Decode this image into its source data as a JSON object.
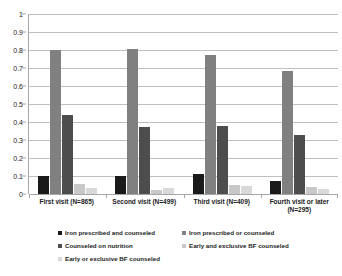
{
  "chart_data": {
    "type": "bar",
    "title": "",
    "subtitle": "",
    "xlabel": "",
    "ylabel": "",
    "ylim": [
      0,
      1
    ],
    "ytick_labels": [
      "1",
      "0.9",
      "0.8",
      "0.7",
      "0.6",
      "0.5",
      "0.4",
      "0.3",
      "0.2",
      "0.1",
      "0"
    ],
    "ytick_values": [
      1,
      0.9,
      0.8,
      0.7,
      0.6,
      0.5,
      0.4,
      0.3,
      0.2,
      0.1,
      0
    ],
    "grid": true,
    "legend_position": "bottom",
    "categories": [
      "First visit (N=865)",
      "Second visit (N=499)",
      "Third visit (N=409)",
      "Fourth visit or later (N=295)"
    ],
    "series": [
      {
        "name": "Iron prescribed and counseled",
        "color": "#1a1a1a",
        "values": [
          0.1,
          0.1,
          0.11,
          0.072
        ]
      },
      {
        "name": "Iron prescribed or counseled",
        "color": "#808080",
        "values": [
          0.8,
          0.805,
          0.775,
          0.685
        ]
      },
      {
        "name": "Counseled on nutrition",
        "color": "#4d4d4d",
        "values": [
          0.44,
          0.37,
          0.38,
          0.33
        ]
      },
      {
        "name": "Early and exclusive BF counseled",
        "color": "#c8c8c8",
        "values": [
          0.055,
          0.02,
          0.048,
          0.038
        ]
      },
      {
        "name": "Early or exclusive BF counseled",
        "color": "#d9d9d9",
        "values": [
          0.035,
          0.035,
          0.045,
          0.028
        ]
      }
    ]
  },
  "legend": {
    "rows": [
      [
        {
          "label": "Iron prescribed and counseled",
          "color": "#1a1a1a"
        },
        {
          "label": "Iron prescribed or counseled",
          "color": "#808080"
        }
      ],
      [
        {
          "label": "Counseled on nutrition",
          "color": "#4d4d4d"
        },
        {
          "label": "Early and exclusive BF counseled",
          "color": "#c8c8c8"
        }
      ],
      [
        {
          "label": "Early or exclusive BF counseled",
          "color": "#d9d9d9"
        }
      ]
    ]
  },
  "colors": {
    "background": "#ffffff",
    "gridline": "#bfbfbf",
    "axis": "#a6a6a6",
    "text": "#1a1a1a"
  }
}
